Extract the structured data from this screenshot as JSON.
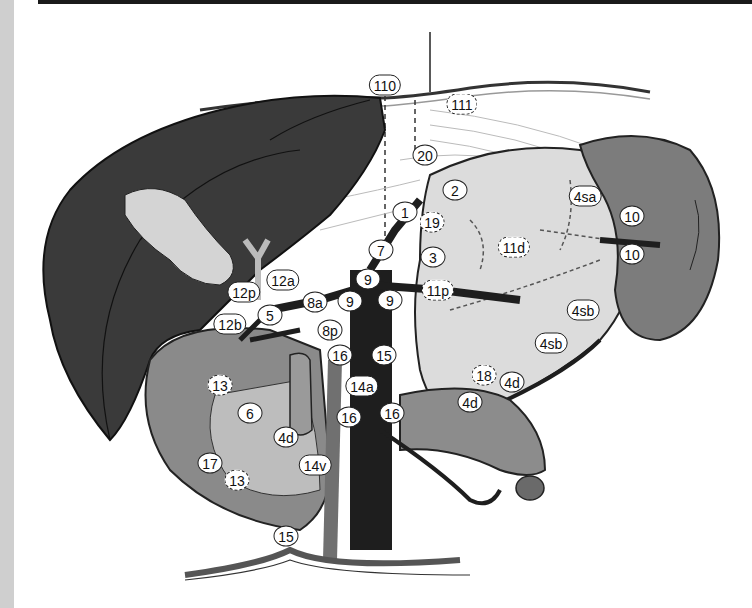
{
  "figure": {
    "colors": {
      "liver": "#3a3a3a",
      "stomach": "#d9d9d9",
      "spleen": "#7a7a7a",
      "pancreas": "#8c8c8c",
      "duodenum": "#8a8a8a",
      "vessels": "#1e1e1e",
      "gallbladder": "#cfcfcf",
      "background": "#ffffff"
    },
    "nodes": [
      {
        "id": "n110",
        "label": "110",
        "x": 385,
        "y": 85,
        "dashed": false
      },
      {
        "id": "n111",
        "label": "111",
        "x": 462,
        "y": 104,
        "dashed": true
      },
      {
        "id": "n20",
        "label": "20",
        "x": 425,
        "y": 155,
        "dashed": false
      },
      {
        "id": "n2",
        "label": "2",
        "x": 455,
        "y": 190,
        "dashed": false
      },
      {
        "id": "n1",
        "label": "1",
        "x": 405,
        "y": 212,
        "dashed": false
      },
      {
        "id": "n19",
        "label": "19",
        "x": 432,
        "y": 222,
        "dashed": true
      },
      {
        "id": "n4sa",
        "label": "4sa",
        "x": 585,
        "y": 196,
        "dashed": false
      },
      {
        "id": "n10a",
        "label": "10",
        "x": 632,
        "y": 216,
        "dashed": false
      },
      {
        "id": "n10b",
        "label": "10",
        "x": 632,
        "y": 254,
        "dashed": false
      },
      {
        "id": "n11d",
        "label": "11d",
        "x": 514,
        "y": 247,
        "dashed": true
      },
      {
        "id": "n3",
        "label": "3",
        "x": 433,
        "y": 257,
        "dashed": false
      },
      {
        "id": "n7",
        "label": "7",
        "x": 381,
        "y": 250,
        "dashed": false
      },
      {
        "id": "n9a",
        "label": "9",
        "x": 368,
        "y": 279,
        "dashed": false
      },
      {
        "id": "n9b",
        "label": "9",
        "x": 350,
        "y": 301,
        "dashed": false
      },
      {
        "id": "n9c",
        "label": "9",
        "x": 390,
        "y": 300,
        "dashed": false
      },
      {
        "id": "n11p",
        "label": "11p",
        "x": 438,
        "y": 290,
        "dashed": true
      },
      {
        "id": "n12a",
        "label": "12a",
        "x": 283,
        "y": 280,
        "dashed": false
      },
      {
        "id": "n12p",
        "label": "12p",
        "x": 244,
        "y": 292,
        "dashed": false
      },
      {
        "id": "n5",
        "label": "5",
        "x": 270,
        "y": 315,
        "dashed": false
      },
      {
        "id": "n12b",
        "label": "12b",
        "x": 230,
        "y": 324,
        "dashed": false
      },
      {
        "id": "n8a",
        "label": "8a",
        "x": 315,
        "y": 302,
        "dashed": false
      },
      {
        "id": "n8p",
        "label": "8p",
        "x": 330,
        "y": 330,
        "dashed": false
      },
      {
        "id": "n4sb1",
        "label": "4sb",
        "x": 583,
        "y": 310,
        "dashed": false
      },
      {
        "id": "n4sb2",
        "label": "4sb",
        "x": 551,
        "y": 343,
        "dashed": false
      },
      {
        "id": "n16a",
        "label": "16",
        "x": 340,
        "y": 355,
        "dashed": false
      },
      {
        "id": "n15a",
        "label": "15",
        "x": 384,
        "y": 355,
        "dashed": false
      },
      {
        "id": "n14a",
        "label": "14a",
        "x": 362,
        "y": 386,
        "dashed": false
      },
      {
        "id": "n16b",
        "label": "16",
        "x": 349,
        "y": 417,
        "dashed": false
      },
      {
        "id": "n16c",
        "label": "16",
        "x": 392,
        "y": 413,
        "dashed": false
      },
      {
        "id": "n18",
        "label": "18",
        "x": 484,
        "y": 375,
        "dashed": true
      },
      {
        "id": "n4d1",
        "label": "4d",
        "x": 512,
        "y": 382,
        "dashed": false
      },
      {
        "id": "n4d2",
        "label": "4d",
        "x": 470,
        "y": 402,
        "dashed": false
      },
      {
        "id": "n4d3",
        "label": "4d",
        "x": 286,
        "y": 437,
        "dashed": false
      },
      {
        "id": "n13a",
        "label": "13",
        "x": 220,
        "y": 385,
        "dashed": true
      },
      {
        "id": "n6",
        "label": "6",
        "x": 250,
        "y": 413,
        "dashed": false
      },
      {
        "id": "n17",
        "label": "17",
        "x": 210,
        "y": 463,
        "dashed": false
      },
      {
        "id": "n13b",
        "label": "13",
        "x": 237,
        "y": 480,
        "dashed": true
      },
      {
        "id": "n14v",
        "label": "14v",
        "x": 315,
        "y": 465,
        "dashed": false
      },
      {
        "id": "n15b",
        "label": "15",
        "x": 286,
        "y": 536,
        "dashed": false
      }
    ]
  }
}
